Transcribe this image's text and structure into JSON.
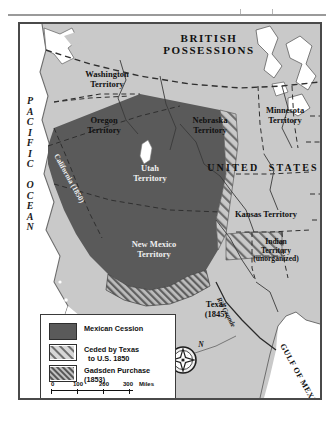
{
  "map": {
    "title_regions": {
      "british": "BRITISH\nPOSSESSIONS",
      "united_states": "UNITED  STATES",
      "mexico": "MEXICO"
    },
    "oceans": {
      "pacific": "PACIFIC OCEAN",
      "gulf": "GULF OF\nMEXICO"
    },
    "territories": [
      {
        "name": "washington",
        "label": "Washington\nTerritory"
      },
      {
        "name": "oregon",
        "label": "Oregon\nTerritory"
      },
      {
        "name": "minnesota",
        "label": "Minnesota\nTerritory"
      },
      {
        "name": "nebraska",
        "label": "Nebraska\nTerritory"
      },
      {
        "name": "utah",
        "label": "Utah\nTerritory"
      },
      {
        "name": "kansas",
        "label": "Kansas Territory"
      },
      {
        "name": "new-mexico",
        "label": "New Mexico\nTerritory"
      },
      {
        "name": "indian",
        "label": "Indian\nTerritory\n(unorganized)"
      },
      {
        "name": "texas",
        "label": "Texas\n(1845)"
      }
    ],
    "inline_labels": {
      "california": "California (1850)",
      "rio_grande": "Rio Grande"
    },
    "compass": {
      "north": "N"
    }
  },
  "legend": {
    "entries": [
      {
        "key": "mexican-cession",
        "label": "Mexican Cession",
        "swatch": "solid"
      },
      {
        "key": "ceded-by-texas",
        "label": "Ceded by Texas\n  to U.S. 1850",
        "swatch": "hatch-light"
      },
      {
        "key": "gadsden-purchase",
        "label": "Gadsden Purchase\n(1853)",
        "swatch": "hatch-dense"
      }
    ],
    "scale": {
      "miles": {
        "ticks": [
          "0",
          "100",
          "200",
          "300"
        ],
        "unit": "Miles"
      },
      "kilometers": {
        "ticks": [
          "0",
          "300"
        ],
        "unit": "Kilometers"
      }
    }
  },
  "colors": {
    "land": "#c9c9c9",
    "cession": "#5a5a5a",
    "water": "#ffffff",
    "border": "#4a4a4a",
    "ink": "#111111"
  }
}
